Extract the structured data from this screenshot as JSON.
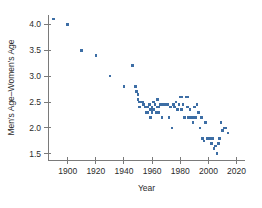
{
  "chart_data": {
    "type": "scatter",
    "title": "",
    "xlabel": "Year",
    "ylabel": "Men's Age–Women's Age",
    "xlim": [
      1886,
      2026
    ],
    "ylim": [
      1.38,
      4.18
    ],
    "grid": false,
    "legend": null,
    "marker_color": "#3d6ea5",
    "marker_shape": "square",
    "xticks": [
      1900,
      1920,
      1940,
      1960,
      1980,
      2000,
      2020
    ],
    "xticklabels": [
      "1900",
      "1920",
      "1940",
      "1960",
      "1980",
      "2000",
      "2020"
    ],
    "yticks": [
      1.5,
      2.0,
      2.5,
      3.0,
      3.5,
      4.0
    ],
    "yticklabels": [
      "1.5",
      "2.0",
      "2.5",
      "3.0",
      "3.5",
      "4.0"
    ],
    "points": [
      {
        "x": 1890,
        "y": 4.1
      },
      {
        "x": 1900,
        "y": 4.0
      },
      {
        "x": 1910,
        "y": 3.5
      },
      {
        "x": 1920,
        "y": 3.4
      },
      {
        "x": 1930,
        "y": 3.0
      },
      {
        "x": 1940,
        "y": 2.8
      },
      {
        "x": 1946,
        "y": 3.2
      },
      {
        "x": 1948,
        "y": 2.8
      },
      {
        "x": 1949,
        "y": 2.7
      },
      {
        "x": 1950,
        "y": 2.65
      },
      {
        "x": 1950,
        "y": 2.55
      },
      {
        "x": 1951,
        "y": 2.5
      },
      {
        "x": 1951,
        "y": 2.4
      },
      {
        "x": 1953,
        "y": 2.5
      },
      {
        "x": 1954,
        "y": 2.45
      },
      {
        "x": 1955,
        "y": 2.4
      },
      {
        "x": 1956,
        "y": 2.4
      },
      {
        "x": 1956,
        "y": 2.3
      },
      {
        "x": 1957,
        "y": 2.4
      },
      {
        "x": 1957,
        "y": 2.3
      },
      {
        "x": 1958,
        "y": 2.45
      },
      {
        "x": 1959,
        "y": 2.35
      },
      {
        "x": 1959,
        "y": 2.2
      },
      {
        "x": 1960,
        "y": 2.4
      },
      {
        "x": 1960,
        "y": 2.3
      },
      {
        "x": 1961,
        "y": 2.5
      },
      {
        "x": 1961,
        "y": 2.35
      },
      {
        "x": 1962,
        "y": 2.45
      },
      {
        "x": 1963,
        "y": 2.3
      },
      {
        "x": 1964,
        "y": 2.55
      },
      {
        "x": 1964,
        "y": 2.4
      },
      {
        "x": 1965,
        "y": 2.4
      },
      {
        "x": 1965,
        "y": 2.3
      },
      {
        "x": 1966,
        "y": 2.45
      },
      {
        "x": 1967,
        "y": 2.2
      },
      {
        "x": 1968,
        "y": 2.45
      },
      {
        "x": 1969,
        "y": 2.45
      },
      {
        "x": 1970,
        "y": 2.45
      },
      {
        "x": 1971,
        "y": 2.45
      },
      {
        "x": 1972,
        "y": 2.2
      },
      {
        "x": 1973,
        "y": 2.4
      },
      {
        "x": 1974,
        "y": 2.0
      },
      {
        "x": 1975,
        "y": 2.45
      },
      {
        "x": 1976,
        "y": 2.4
      },
      {
        "x": 1977,
        "y": 2.5
      },
      {
        "x": 1978,
        "y": 2.35
      },
      {
        "x": 1979,
        "y": 2.45
      },
      {
        "x": 1980,
        "y": 2.6
      },
      {
        "x": 1981,
        "y": 2.6
      },
      {
        "x": 1981,
        "y": 2.35
      },
      {
        "x": 1982,
        "y": 2.45
      },
      {
        "x": 1983,
        "y": 2.2
      },
      {
        "x": 1984,
        "y": 2.6
      },
      {
        "x": 1985,
        "y": 2.6
      },
      {
        "x": 1985,
        "y": 2.4
      },
      {
        "x": 1986,
        "y": 2.2
      },
      {
        "x": 1987,
        "y": 2.35
      },
      {
        "x": 1988,
        "y": 2.2
      },
      {
        "x": 1989,
        "y": 2.2
      },
      {
        "x": 1989,
        "y": 2.1
      },
      {
        "x": 1990,
        "y": 2.4
      },
      {
        "x": 1991,
        "y": 2.2
      },
      {
        "x": 1992,
        "y": 2.45
      },
      {
        "x": 1993,
        "y": 2.3
      },
      {
        "x": 1994,
        "y": 2.0
      },
      {
        "x": 1995,
        "y": 2.2
      },
      {
        "x": 1996,
        "y": 1.8
      },
      {
        "x": 1997,
        "y": 1.75
      },
      {
        "x": 1998,
        "y": 2.1
      },
      {
        "x": 1999,
        "y": 1.8
      },
      {
        "x": 2000,
        "y": 1.8
      },
      {
        "x": 2001,
        "y": 1.8
      },
      {
        "x": 2002,
        "y": 1.8
      },
      {
        "x": 2002,
        "y": 1.7
      },
      {
        "x": 2003,
        "y": 1.8
      },
      {
        "x": 2004,
        "y": 1.6
      },
      {
        "x": 2005,
        "y": 1.65
      },
      {
        "x": 2006,
        "y": 1.5
      },
      {
        "x": 2007,
        "y": 1.7
      },
      {
        "x": 2008,
        "y": 1.8
      },
      {
        "x": 2009,
        "y": 2.1
      },
      {
        "x": 2010,
        "y": 1.95
      },
      {
        "x": 2011,
        "y": 2.0
      },
      {
        "x": 2012,
        "y": 2.0
      },
      {
        "x": 2014,
        "y": 1.9
      }
    ]
  }
}
